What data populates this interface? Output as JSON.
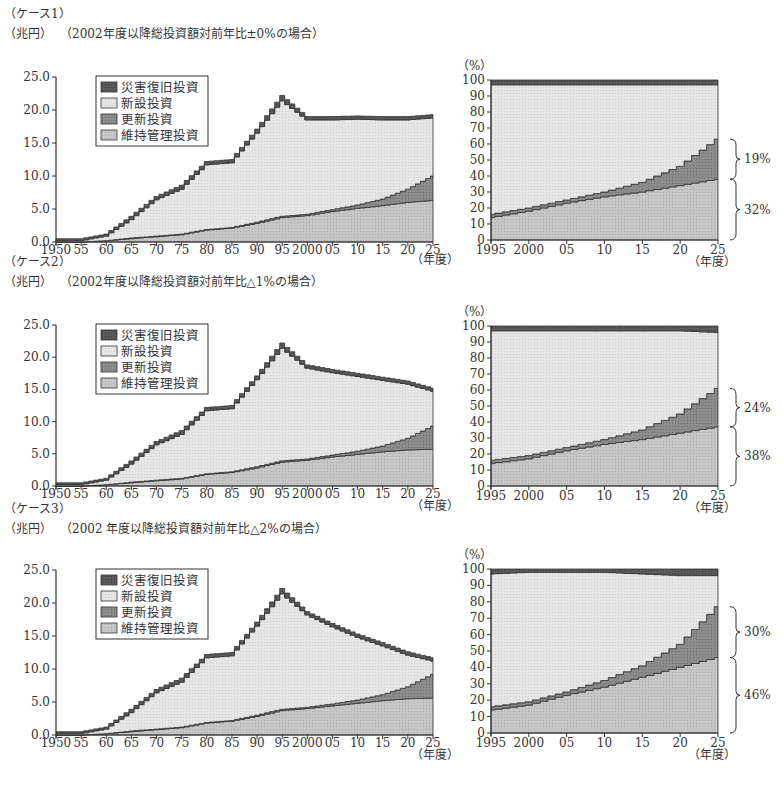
{
  "legend": [
    "災害復旧投資",
    "新設投資",
    "更新投資",
    "維持管理投資"
  ],
  "colors": {
    "disaster": "#555555",
    "new": "#e4e4e4",
    "renewal": "#8a8a8a",
    "maintenance": "#c4c4c4",
    "axis": "#333333"
  },
  "units": {
    "left": "（兆円）",
    "right": "（%）",
    "x": "（年度）"
  },
  "cases": [
    {
      "label": "（ケース1）",
      "subtitle": "（2002年度以降総投資額対前年比±0%の場合）",
      "bracket_upper": "19%",
      "bracket_lower": "32%"
    },
    {
      "label": "（ケース2）",
      "subtitle": "（2002年度以降総投資額対前年比△1%の場合）",
      "bracket_upper": "24%",
      "bracket_lower": "38%"
    },
    {
      "label": "（ケース3）",
      "subtitle": "（2002 年度以降総投資額対前年比△2%の場合）",
      "bracket_upper": "30%",
      "bracket_lower": "46%"
    }
  ],
  "chart_data": [
    {
      "type": "area",
      "title": "（ケース1）（2002年度以降総投資額対前年比±0%の場合）",
      "xlabel": "（年度）",
      "ylabel": "（兆円）",
      "ylim": [
        0,
        25
      ],
      "yticks": [
        "0.0",
        "5.0",
        "10.0",
        "15.0",
        "20.0",
        "25.0"
      ],
      "xticks": [
        "1950",
        "55",
        "60",
        "65",
        "70",
        "75",
        "80",
        "85",
        "90",
        "95",
        "2000",
        "05",
        "10",
        "15",
        "20",
        "25"
      ],
      "x": [
        1950,
        1955,
        1960,
        1965,
        1970,
        1975,
        1980,
        1985,
        1990,
        1995,
        2000,
        2005,
        2010,
        2015,
        2020,
        2025
      ],
      "series": [
        {
          "name": "維持管理投資",
          "values": [
            0.0,
            0.0,
            0.2,
            0.5,
            0.8,
            1.1,
            1.8,
            2.1,
            2.8,
            3.7,
            4.0,
            4.6,
            5.1,
            5.5,
            6.0,
            6.3
          ]
        },
        {
          "name": "更新投資",
          "values": [
            0.0,
            0.0,
            0.0,
            0.1,
            0.1,
            0.1,
            0.1,
            0.1,
            0.2,
            0.2,
            0.2,
            0.3,
            0.5,
            1.0,
            2.0,
            3.7
          ]
        },
        {
          "name": "新設投資",
          "values": [
            0.2,
            0.2,
            0.7,
            2.8,
            5.5,
            6.8,
            9.8,
            9.8,
            13.5,
            17.5,
            14.3,
            13.6,
            13.0,
            12.0,
            10.5,
            8.8
          ]
        },
        {
          "name": "災害復旧投資",
          "values": [
            0.3,
            0.3,
            0.3,
            0.5,
            0.5,
            0.6,
            0.5,
            0.5,
            0.6,
            0.8,
            0.5,
            0.5,
            0.5,
            0.5,
            0.5,
            0.5
          ]
        }
      ]
    },
    {
      "type": "area",
      "title": "（ケース1）構成比",
      "xlabel": "（年度）",
      "ylabel": "（%）",
      "ylim": [
        0,
        100
      ],
      "yticks": [
        "0",
        "10",
        "20",
        "30",
        "40",
        "50",
        "60",
        "70",
        "80",
        "90",
        "100"
      ],
      "xticks": [
        "1995",
        "2000",
        "05",
        "10",
        "15",
        "20",
        "25"
      ],
      "x": [
        1995,
        2000,
        2005,
        2010,
        2015,
        2020,
        2025
      ],
      "series": [
        {
          "name": "維持管理投資",
          "values": [
            14,
            18,
            23,
            27,
            30,
            34,
            38
          ]
        },
        {
          "name": "更新投資",
          "values": [
            2,
            2,
            2,
            3,
            6,
            12,
            25
          ]
        },
        {
          "name": "新設投資",
          "values": [
            81,
            77,
            72,
            67,
            61,
            51,
            34
          ]
        },
        {
          "name": "災害復旧投資",
          "values": [
            3,
            3,
            3,
            3,
            3,
            3,
            3
          ]
        }
      ],
      "annotations": [
        "19%",
        "32%"
      ]
    },
    {
      "type": "area",
      "title": "（ケース2）（2002年度以降総投資額対前年比△1%の場合）",
      "xlabel": "（年度）",
      "ylabel": "（兆円）",
      "ylim": [
        0,
        25
      ],
      "yticks": [
        "0.0",
        "5.0",
        "10.0",
        "15.0",
        "20.0",
        "25.0"
      ],
      "xticks": [
        "1950",
        "55",
        "60",
        "65",
        "70",
        "75",
        "80",
        "85",
        "90",
        "95",
        "2000",
        "05",
        "10",
        "15",
        "20",
        "25"
      ],
      "x": [
        1950,
        1955,
        1960,
        1965,
        1970,
        1975,
        1980,
        1985,
        1990,
        1995,
        2000,
        2005,
        2010,
        2015,
        2020,
        2025
      ],
      "series": [
        {
          "name": "維持管理投資",
          "values": [
            0.0,
            0.0,
            0.2,
            0.5,
            0.8,
            1.1,
            1.8,
            2.1,
            2.8,
            3.7,
            4.0,
            4.5,
            4.9,
            5.3,
            5.6,
            5.7
          ]
        },
        {
          "name": "更新投資",
          "values": [
            0.0,
            0.0,
            0.0,
            0.1,
            0.1,
            0.1,
            0.1,
            0.1,
            0.2,
            0.2,
            0.2,
            0.3,
            0.5,
            0.9,
            1.8,
            3.6
          ]
        },
        {
          "name": "新設投資",
          "values": [
            0.2,
            0.2,
            0.7,
            2.8,
            5.5,
            6.8,
            9.8,
            9.8,
            13.5,
            17.5,
            14.1,
            12.8,
            11.6,
            10.2,
            8.4,
            5.4
          ]
        },
        {
          "name": "災害復旧投資",
          "values": [
            0.3,
            0.3,
            0.3,
            0.5,
            0.5,
            0.6,
            0.5,
            0.5,
            0.6,
            0.8,
            0.5,
            0.5,
            0.5,
            0.5,
            0.5,
            0.5
          ]
        }
      ]
    },
    {
      "type": "area",
      "title": "（ケース2）構成比",
      "xlabel": "（年度）",
      "ylabel": "（%）",
      "ylim": [
        0,
        100
      ],
      "yticks": [
        "0",
        "10",
        "20",
        "30",
        "40",
        "50",
        "60",
        "70",
        "80",
        "90",
        "100"
      ],
      "xticks": [
        "1995",
        "2000",
        "05",
        "10",
        "15",
        "20",
        "25"
      ],
      "x": [
        1995,
        2000,
        2005,
        2010,
        2015,
        2020,
        2025
      ],
      "series": [
        {
          "name": "維持管理投資",
          "values": [
            14,
            17,
            22,
            26,
            29,
            33,
            37
          ]
        },
        {
          "name": "更新投資",
          "values": [
            2,
            2,
            2,
            3,
            6,
            12,
            24
          ]
        },
        {
          "name": "新設投資",
          "values": [
            81,
            78,
            73,
            68,
            62,
            52,
            35
          ]
        },
        {
          "name": "災害復旧投資",
          "values": [
            3,
            3,
            3,
            3,
            3,
            3,
            4
          ]
        }
      ],
      "annotations": [
        "24%",
        "38%"
      ]
    },
    {
      "type": "area",
      "title": "（ケース3）（2002 年度以降総投資額対前年比△2%の場合）",
      "xlabel": "（年度）",
      "ylabel": "（兆円）",
      "ylim": [
        0,
        25
      ],
      "yticks": [
        "0.0",
        "5.0",
        "10.0",
        "15.0",
        "20.0",
        "25.0"
      ],
      "xticks": [
        "1950",
        "55",
        "60",
        "65",
        "70",
        "75",
        "80",
        "85",
        "90",
        "95",
        "2000",
        "05",
        "10",
        "15",
        "20",
        "25"
      ],
      "x": [
        1950,
        1955,
        1960,
        1965,
        1970,
        1975,
        1980,
        1985,
        1990,
        1995,
        2000,
        2005,
        2010,
        2015,
        2020,
        2025
      ],
      "series": [
        {
          "name": "維持管理投資",
          "values": [
            0.0,
            0.0,
            0.2,
            0.5,
            0.8,
            1.1,
            1.8,
            2.1,
            2.8,
            3.7,
            4.0,
            4.4,
            4.8,
            5.2,
            5.5,
            5.6
          ]
        },
        {
          "name": "更新投資",
          "values": [
            0.0,
            0.0,
            0.0,
            0.1,
            0.1,
            0.1,
            0.1,
            0.1,
            0.2,
            0.2,
            0.2,
            0.3,
            0.5,
            0.9,
            1.8,
            3.6
          ]
        },
        {
          "name": "新設投資",
          "values": [
            0.2,
            0.2,
            0.7,
            2.8,
            5.5,
            6.8,
            9.8,
            9.8,
            13.5,
            17.5,
            14.0,
            11.7,
            9.5,
            7.4,
            4.8,
            2.0
          ]
        },
        {
          "name": "災害復旧投資",
          "values": [
            0.3,
            0.3,
            0.3,
            0.5,
            0.5,
            0.6,
            0.5,
            0.5,
            0.6,
            0.8,
            0.5,
            0.5,
            0.5,
            0.5,
            0.5,
            0.5
          ]
        }
      ]
    },
    {
      "type": "area",
      "title": "（ケース3）構成比",
      "xlabel": "（年度）",
      "ylabel": "（%）",
      "ylim": [
        0,
        100
      ],
      "yticks": [
        "0",
        "10",
        "20",
        "30",
        "40",
        "50",
        "60",
        "70",
        "80",
        "90",
        "100"
      ],
      "xticks": [
        "1995",
        "2000",
        "05",
        "10",
        "15",
        "20",
        "25"
      ],
      "x": [
        1995,
        2000,
        2005,
        2010,
        2015,
        2020,
        2025
      ],
      "series": [
        {
          "name": "維持管理投資",
          "values": [
            14,
            17,
            23,
            28,
            34,
            40,
            46
          ]
        },
        {
          "name": "更新投資",
          "values": [
            2,
            2,
            2,
            4,
            7,
            14,
            31
          ]
        },
        {
          "name": "新設投資",
          "values": [
            81,
            79,
            73,
            66,
            56,
            42,
            19
          ]
        },
        {
          "name": "災害復旧投資",
          "values": [
            3,
            2,
            2,
            2,
            3,
            4,
            4
          ]
        }
      ],
      "annotations": [
        "30%",
        "46%"
      ]
    }
  ]
}
